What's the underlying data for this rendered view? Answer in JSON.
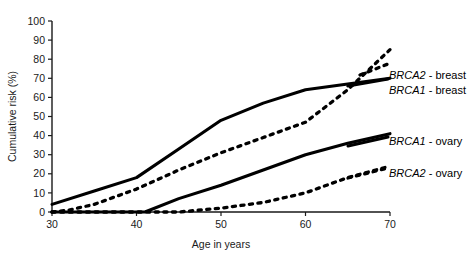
{
  "chart_data": {
    "type": "line",
    "title": "",
    "xlabel": "Age in years",
    "ylabel": "Cumulative risk (%)",
    "xlim": [
      30,
      70
    ],
    "ylim": [
      0,
      100
    ],
    "xticks": [
      30,
      40,
      50,
      60,
      70
    ],
    "yticks": [
      0,
      10,
      20,
      30,
      40,
      50,
      60,
      70,
      80,
      90,
      100
    ],
    "grid": false,
    "legend_position": "right-inline",
    "series": [
      {
        "name": "BRCA2 - breast",
        "gene": "BRCA2",
        "site": "breast",
        "style": "dashed",
        "color": "#000000",
        "x": [
          30,
          32,
          35,
          40,
          45,
          50,
          55,
          60,
          65,
          70
        ],
        "values": [
          0,
          1,
          4,
          12,
          22,
          31,
          39,
          47,
          64,
          85
        ]
      },
      {
        "name": "BRCA1 - breast",
        "gene": "BRCA1",
        "site": "breast",
        "style": "solid",
        "color": "#000000",
        "x": [
          30,
          35,
          40,
          45,
          50,
          55,
          60,
          65,
          70
        ],
        "values": [
          4,
          11,
          18,
          33,
          48,
          57,
          64,
          67,
          70
        ]
      },
      {
        "name": "BRCA1 - ovary",
        "gene": "BRCA1",
        "site": "ovary",
        "style": "solid",
        "color": "#000000",
        "x": [
          30,
          41,
          45,
          50,
          55,
          60,
          65,
          70
        ],
        "values": [
          0,
          0,
          7,
          14,
          22,
          30,
          36,
          41
        ]
      },
      {
        "name": "BRCA2 - ovary",
        "gene": "BRCA2",
        "site": "ovary",
        "style": "dashed",
        "color": "#000000",
        "x": [
          30,
          45,
          50,
          55,
          60,
          65,
          70
        ],
        "values": [
          0,
          0,
          2,
          5,
          10,
          18,
          24
        ]
      }
    ]
  },
  "axes": {
    "x_label": "Age in years",
    "y_label": "Cumulative risk (%)",
    "x_tick_labels": [
      "30",
      "40",
      "50",
      "60",
      "70"
    ],
    "y_tick_labels": [
      "0",
      "10",
      "20",
      "30",
      "40",
      "50",
      "60",
      "70",
      "80",
      "90",
      "100"
    ]
  },
  "legend": {
    "items": [
      {
        "gene": "BRCA2",
        "suffix": " - breast",
        "full": "BRCA2 - breast"
      },
      {
        "gene": "BRCA1",
        "suffix": " - breast",
        "full": "BRCA1 - breast"
      },
      {
        "gene": "BRCA1",
        "suffix": " - ovary",
        "full": "BRCA1 - ovary"
      },
      {
        "gene": "BRCA2",
        "suffix": " - ovary",
        "full": "BRCA2 - ovary"
      }
    ]
  },
  "colors": {
    "ink": "#000000",
    "background": "#ffffff"
  }
}
